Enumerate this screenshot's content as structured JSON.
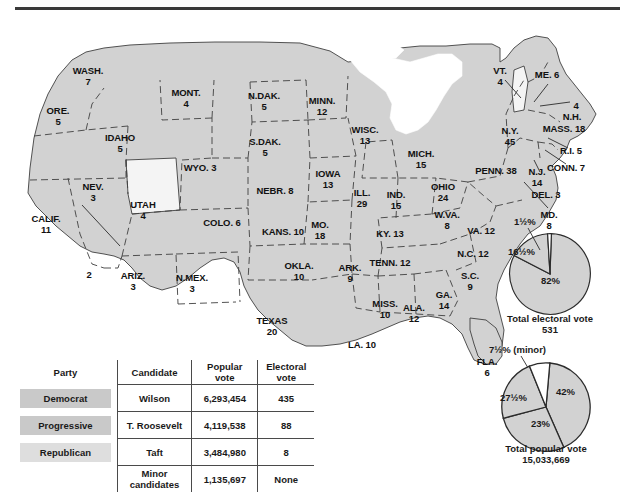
{
  "map": {
    "title_rule": true,
    "colors": {
      "democrat_fill": "#d2d2d2",
      "other_fill": "#f4f4f4",
      "outline": "#3f3f3f",
      "rule": "#3a3a3a",
      "swatch_dark": "#c9c9c9",
      "swatch_light": "#dedede"
    },
    "states": [
      {
        "name": "WASH.",
        "votes": "7",
        "x": 88,
        "y": 48,
        "fill": "democrat"
      },
      {
        "name": "ORE.",
        "votes": "5",
        "x": 58,
        "y": 88,
        "fill": "democrat"
      },
      {
        "name": "IDAHO",
        "votes": "5",
        "x": 120,
        "y": 115,
        "fill": "democrat"
      },
      {
        "name": "MONT.",
        "votes": "4",
        "x": 186,
        "y": 70,
        "fill": "democrat"
      },
      {
        "name": "WYO. 3",
        "votes": "",
        "x": 200,
        "y": 145,
        "fill": "democrat"
      },
      {
        "name": "NEV.",
        "votes": "3",
        "x": 93,
        "y": 164,
        "fill": "democrat"
      },
      {
        "name": "UTAH",
        "votes": "4",
        "x": 143,
        "y": 182,
        "fill": "other"
      },
      {
        "name": "CALIF.",
        "votes": "11",
        "x": 46,
        "y": 196,
        "fill": "democrat"
      },
      {
        "name": "2",
        "votes": "",
        "x": 89,
        "y": 252,
        "fill": "democrat"
      },
      {
        "name": "ARIZ.",
        "votes": "3",
        "x": 133,
        "y": 253,
        "fill": "democrat"
      },
      {
        "name": "N.MEX.",
        "votes": "3",
        "x": 192,
        "y": 255,
        "fill": "democrat"
      },
      {
        "name": "COLO. 6",
        "votes": "",
        "x": 222,
        "y": 200,
        "fill": "democrat"
      },
      {
        "name": "N.DAK.",
        "votes": "5",
        "x": 264,
        "y": 73,
        "fill": "democrat"
      },
      {
        "name": "S.DAK.",
        "votes": "5",
        "x": 265,
        "y": 119,
        "fill": "democrat"
      },
      {
        "name": "NEBR. 8",
        "votes": "",
        "x": 275,
        "y": 168,
        "fill": "democrat"
      },
      {
        "name": "KANS. 10",
        "votes": "",
        "x": 283,
        "y": 209,
        "fill": "democrat"
      },
      {
        "name": "OKLA.",
        "votes": "10",
        "x": 299,
        "y": 243,
        "fill": "democrat"
      },
      {
        "name": "TEXAS",
        "votes": "20",
        "x": 272,
        "y": 298,
        "fill": "democrat"
      },
      {
        "name": "MINN.",
        "votes": "12",
        "x": 322,
        "y": 78,
        "fill": "democrat"
      },
      {
        "name": "IOWA",
        "votes": "13",
        "x": 328,
        "y": 151,
        "fill": "democrat"
      },
      {
        "name": "MO.",
        "votes": "18",
        "x": 320,
        "y": 202,
        "fill": "democrat"
      },
      {
        "name": "ARK.",
        "votes": "9",
        "x": 350,
        "y": 245,
        "fill": "democrat"
      },
      {
        "name": "LA. 10",
        "votes": "",
        "x": 362,
        "y": 322,
        "fill": "democrat"
      },
      {
        "name": "WISC.",
        "votes": "13",
        "x": 365,
        "y": 107,
        "fill": "democrat"
      },
      {
        "name": "ILL.",
        "votes": "29",
        "x": 362,
        "y": 170,
        "fill": "democrat"
      },
      {
        "name": "MICH.",
        "votes": "15",
        "x": 421,
        "y": 131,
        "fill": "democrat"
      },
      {
        "name": "IND.",
        "votes": "15",
        "x": 396,
        "y": 172,
        "fill": "democrat"
      },
      {
        "name": "OHIO",
        "votes": "24",
        "x": 443,
        "y": 164,
        "fill": "democrat"
      },
      {
        "name": "KY. 13",
        "votes": "",
        "x": 390,
        "y": 211,
        "fill": "democrat"
      },
      {
        "name": "TENN. 12",
        "votes": "",
        "x": 390,
        "y": 240,
        "fill": "democrat"
      },
      {
        "name": "MISS.",
        "votes": "10",
        "x": 385,
        "y": 281,
        "fill": "democrat"
      },
      {
        "name": "ALA.",
        "votes": "12",
        "x": 414,
        "y": 285,
        "fill": "democrat"
      },
      {
        "name": "GA.",
        "votes": "14",
        "x": 444,
        "y": 272,
        "fill": "democrat"
      },
      {
        "name": "FLA.",
        "votes": "6",
        "x": 487,
        "y": 339,
        "fill": "democrat"
      },
      {
        "name": "S.C.",
        "votes": "9",
        "x": 470,
        "y": 253,
        "fill": "democrat"
      },
      {
        "name": "N.C. 12",
        "votes": "",
        "x": 473,
        "y": 231,
        "fill": "democrat"
      },
      {
        "name": "VA. 12",
        "votes": "",
        "x": 481,
        "y": 208,
        "fill": "democrat"
      },
      {
        "name": "W.VA.",
        "votes": "8",
        "x": 447,
        "y": 192,
        "fill": "democrat"
      },
      {
        "name": "MD.",
        "votes": "8",
        "x": 549,
        "y": 192,
        "fill": "democrat"
      },
      {
        "name": "DEL. 3",
        "votes": "",
        "x": 546,
        "y": 172,
        "fill": "democrat"
      },
      {
        "name": "PENN. 38",
        "votes": "",
        "x": 496,
        "y": 148,
        "fill": "democrat"
      },
      {
        "name": "N.J.",
        "votes": "14",
        "x": 537,
        "y": 149,
        "fill": "democrat"
      },
      {
        "name": "N.Y.",
        "votes": "45",
        "x": 510,
        "y": 108,
        "fill": "democrat"
      },
      {
        "name": "CONN. 7",
        "votes": "",
        "x": 566,
        "y": 145,
        "fill": "democrat"
      },
      {
        "name": "R.I. 5",
        "votes": "",
        "x": 571,
        "y": 128,
        "fill": "democrat"
      },
      {
        "name": "MASS. 18",
        "votes": "",
        "x": 564,
        "y": 106,
        "fill": "democrat"
      },
      {
        "name": "N.H.",
        "votes": "",
        "x": 572,
        "y": 94,
        "fill": "democrat"
      },
      {
        "name": "4",
        "votes": "",
        "x": 576,
        "y": 83,
        "fill": "democrat"
      },
      {
        "name": "ME. 6",
        "votes": "",
        "x": 547,
        "y": 52,
        "fill": "democrat"
      },
      {
        "name": "VT.",
        "votes": "4",
        "x": 500,
        "y": 48,
        "fill": "other"
      }
    ]
  },
  "table": {
    "headers": {
      "party": "Party",
      "candidate": "Candidate",
      "popular_vote": "Popular\nvote",
      "electoral_vote": "Electoral\nvote"
    },
    "rows": [
      {
        "party": "Democrat",
        "candidate": "Wilson",
        "popular": "6,293,454",
        "electoral": "435"
      },
      {
        "party": "Progressive",
        "candidate": "T. Roosevelt",
        "popular": "4,119,538",
        "electoral": "88"
      },
      {
        "party": "Republican",
        "candidate": "Taft",
        "popular": "3,484,980",
        "electoral": "8"
      },
      {
        "party": "",
        "candidate": "Minor\ncandidates",
        "popular": "1,135,697",
        "electoral": "None"
      }
    ]
  },
  "chart_data": [
    {
      "type": "pie",
      "title": "Total electoral vote",
      "subtitle": "531",
      "categories": [
        "Wilson",
        "T. Roosevelt",
        "Taft"
      ],
      "labels": [
        "82%",
        "16½%",
        "1½%"
      ],
      "values": [
        82,
        16.5,
        1.5
      ],
      "colors": [
        "#d2d2d2",
        "#d2d2d2",
        "#ffffff"
      ],
      "legend": "none"
    },
    {
      "type": "pie",
      "title": "Total popular vote",
      "subtitle": "15,033,669",
      "categories": [
        "Wilson",
        "T. Roosevelt",
        "Taft",
        "Minor"
      ],
      "labels": [
        "42%",
        "27½%",
        "23%",
        "7½% (minor)"
      ],
      "values": [
        42,
        27.5,
        23,
        7.5
      ],
      "colors": [
        "#d2d2d2",
        "#d2d2d2",
        "#d2d2d2",
        "#ffffff"
      ],
      "legend": "none"
    }
  ]
}
